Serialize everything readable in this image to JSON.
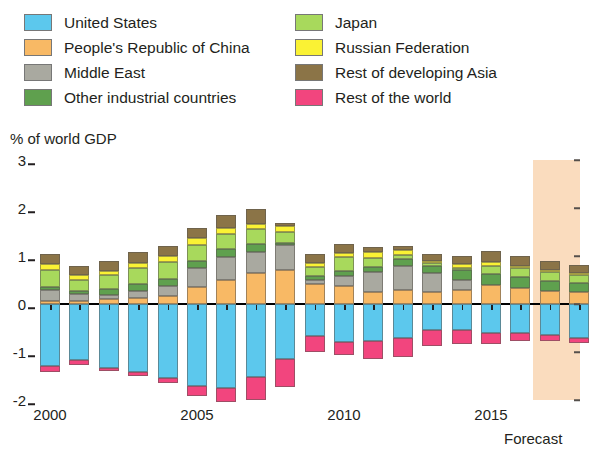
{
  "legend": {
    "columns": [
      [
        {
          "label": "United States",
          "color": "#5CC8ED",
          "key": "us"
        },
        {
          "label": "People's Republic of China",
          "color": "#F8B965",
          "key": "prc"
        },
        {
          "label": "Middle East",
          "color": "#A9A9A0",
          "key": "me"
        },
        {
          "label": "Other industrial countries",
          "color": "#5FA04E",
          "key": "oic"
        }
      ],
      [
        {
          "label": "Japan",
          "color": "#A8D95C",
          "key": "jpn"
        },
        {
          "label": "Russian Federation",
          "color": "#FAF234",
          "key": "rus"
        },
        {
          "label": "Rest of developing Asia",
          "color": "#8B7447",
          "key": "rda"
        },
        {
          "label": "Rest of the world",
          "color": "#F2457E",
          "key": "row"
        }
      ]
    ]
  },
  "axis": {
    "y_title": "% of world GDP",
    "y_ticks": [
      "3",
      "2",
      "1",
      "0",
      "-1",
      "-2"
    ],
    "x_ticks": [
      {
        "label": "2000",
        "year": 2000
      },
      {
        "label": "2005",
        "year": 2005
      },
      {
        "label": "2010",
        "year": 2010
      },
      {
        "label": "2015",
        "year": 2015
      }
    ],
    "forecast_label": "Forecast",
    "forecast_color": "#FADCBE",
    "zero_line_color": "#000000"
  },
  "chart_data": {
    "type": "bar",
    "stacked": true,
    "title": "",
    "xlabel": "",
    "ylabel": "% of world GDP",
    "ylim": [
      -2,
      3
    ],
    "grid": false,
    "legend_position": "top",
    "annotations": [
      {
        "text": "Forecast",
        "from_year": 2017,
        "to_year": 2018
      }
    ],
    "categories": [
      "2000",
      "2001",
      "2002",
      "2003",
      "2004",
      "2005",
      "2006",
      "2007",
      "2008",
      "2009",
      "2010",
      "2011",
      "2012",
      "2013",
      "2014",
      "2015",
      "2016",
      "2017",
      "2018"
    ],
    "forecast_from": 2017,
    "series": [
      {
        "name": "United States",
        "color": "#5CC8ED",
        "values": [
          -1.3,
          -1.17,
          -1.34,
          -1.42,
          -1.55,
          -1.7,
          -1.74,
          -1.52,
          -1.15,
          -0.67,
          -0.8,
          -0.77,
          -0.7,
          -0.55,
          -0.55,
          -0.6,
          -0.6,
          -0.65,
          -0.7
        ]
      },
      {
        "name": "People's Republic of China",
        "color": "#F8B965",
        "values": [
          0.06,
          0.06,
          0.1,
          0.13,
          0.16,
          0.35,
          0.5,
          0.65,
          0.7,
          0.42,
          0.38,
          0.24,
          0.3,
          0.24,
          0.3,
          0.4,
          0.34,
          0.28,
          0.25
        ]
      },
      {
        "name": "Middle East",
        "color": "#A9A9A0",
        "values": [
          0.23,
          0.14,
          0.09,
          0.15,
          0.22,
          0.39,
          0.47,
          0.43,
          0.52,
          0.08,
          0.21,
          0.43,
          0.5,
          0.4,
          0.21,
          0.0,
          0.0,
          0.0,
          0.0
        ]
      },
      {
        "name": "Other industrial countries",
        "color": "#5FA04E",
        "values": [
          0.06,
          0.07,
          0.12,
          0.14,
          0.15,
          0.16,
          0.17,
          0.16,
          0.06,
          0.08,
          0.1,
          0.1,
          0.13,
          0.16,
          0.2,
          0.22,
          0.22,
          0.2,
          0.18
        ]
      },
      {
        "name": "Japan",
        "color": "#A8D95C",
        "values": [
          0.35,
          0.23,
          0.3,
          0.33,
          0.35,
          0.33,
          0.31,
          0.33,
          0.22,
          0.2,
          0.28,
          0.18,
          0.09,
          0.05,
          0.05,
          0.18,
          0.19,
          0.18,
          0.17
        ]
      },
      {
        "name": "Russian Federation",
        "color": "#FAF234",
        "values": [
          0.14,
          0.11,
          0.08,
          0.1,
          0.13,
          0.14,
          0.14,
          0.1,
          0.13,
          0.08,
          0.1,
          0.13,
          0.1,
          0.05,
          0.07,
          0.08,
          0.04,
          0.04,
          0.04
        ]
      },
      {
        "name": "Rest of developing Asia",
        "color": "#8B7447",
        "values": [
          0.2,
          0.18,
          0.2,
          0.23,
          0.19,
          0.22,
          0.26,
          0.31,
          0.06,
          0.18,
          0.17,
          0.1,
          0.08,
          0.14,
          0.18,
          0.22,
          0.22,
          0.2,
          0.18
        ]
      },
      {
        "name": "Rest of the world",
        "color": "#F2457E",
        "values": [
          -0.12,
          -0.1,
          -0.06,
          -0.08,
          -0.1,
          -0.22,
          -0.3,
          -0.47,
          -0.58,
          -0.32,
          -0.27,
          -0.38,
          -0.4,
          -0.33,
          -0.28,
          -0.24,
          -0.18,
          -0.12,
          -0.12
        ]
      }
    ]
  }
}
